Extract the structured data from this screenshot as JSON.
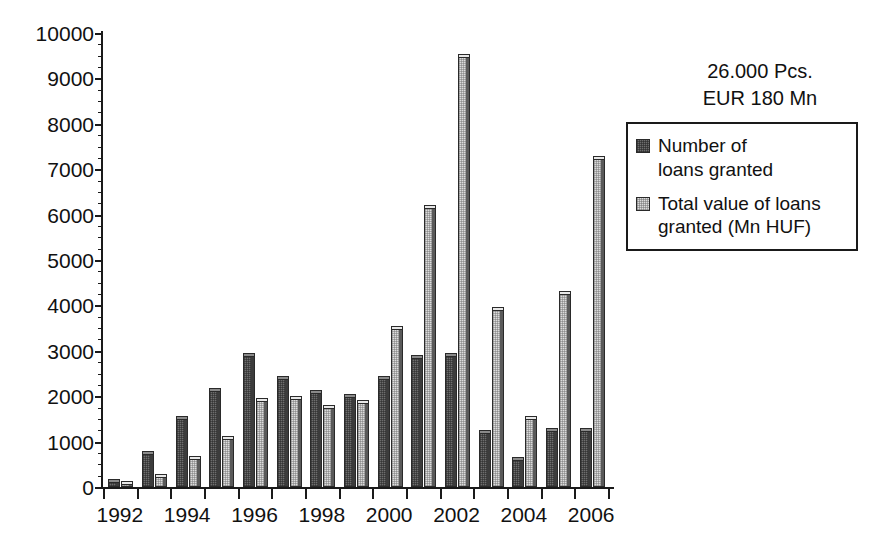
{
  "chart_data": {
    "type": "bar",
    "title": "",
    "xlabel": "",
    "ylabel": "",
    "ylim": [
      0,
      10000
    ],
    "ytick_step": 1000,
    "yminor_step": 250,
    "grid": false,
    "legend_position": "right",
    "categories": [
      1992,
      1993,
      1994,
      1995,
      1996,
      1997,
      1998,
      1999,
      2000,
      2001,
      2002,
      2003,
      2004,
      2005,
      2006
    ],
    "xtick_labels": [
      "1992",
      "1994",
      "1996",
      "1998",
      "2000",
      "2002",
      "2004",
      "2006"
    ],
    "ytick_labels": [
      "0",
      "1000",
      "2000",
      "3000",
      "4000",
      "5000",
      "6000",
      "7000",
      "8000",
      "9000",
      "10000"
    ],
    "series": [
      {
        "name": "Number of loans granted",
        "key": "dark",
        "values": [
          110,
          720,
          1500,
          2120,
          2880,
          2380,
          2070,
          1980,
          2380,
          2840,
          2880,
          1180,
          600,
          1230,
          1240
        ]
      },
      {
        "name": "Total value of loans granted (Mn HUF)",
        "key": "light",
        "values": [
          60,
          210,
          620,
          1050,
          1900,
          1940,
          1740,
          1860,
          3480,
          6150,
          9480,
          3900,
          1490,
          4250,
          7220
        ]
      }
    ],
    "annotations": [
      "26.000 Pcs.",
      "EUR 180 Mn"
    ]
  },
  "annotation": {
    "line1": "26.000 Pcs.",
    "line2": "EUR 180 Mn"
  },
  "legend": {
    "items": [
      {
        "label": "Number of\nloans granted",
        "swatch": "dark"
      },
      {
        "label": "Total value of loans\ngranted (Mn HUF)",
        "swatch": "light"
      }
    ]
  },
  "colors": {
    "series_dark": "#6e6e6e",
    "series_light": "#dcdcdc",
    "axis": "#1a1a1a",
    "text": "#111111",
    "background": "#ffffff"
  }
}
